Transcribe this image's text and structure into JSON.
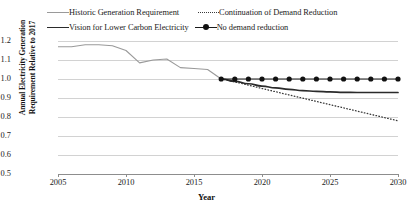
{
  "chart_data": {
    "type": "line",
    "title": "",
    "xlabel": "Year",
    "ylabel": "Annual Electricity Generation Requirement Relative to 2017",
    "ylabel_line1": "Annual Electricity Generation",
    "ylabel_line2": "Requirement Relative to 2017",
    "xlim": [
      2005,
      2030
    ],
    "ylim": [
      0.5,
      1.2
    ],
    "xticks": [
      2005,
      2010,
      2015,
      2020,
      2025,
      2030
    ],
    "yticks": [
      "0.5",
      "0.6",
      "0.7",
      "0.8",
      "0.9",
      "1.0",
      "1.1",
      "1.2"
    ],
    "grid": true,
    "legend_position": "top",
    "series": [
      {
        "name": "Historic Generation Requirement",
        "style": "solid-thin",
        "color": "#9a9a9a",
        "x": [
          2005,
          2006,
          2007,
          2008,
          2009,
          2010,
          2011,
          2012,
          2013,
          2014,
          2015,
          2016,
          2017
        ],
        "values": [
          1.17,
          1.17,
          1.18,
          1.18,
          1.175,
          1.15,
          1.085,
          1.1,
          1.105,
          1.06,
          1.055,
          1.05,
          1.0
        ]
      },
      {
        "name": "Continuation of Demand Reduction",
        "style": "dotted",
        "color": "#3a3a3a",
        "x": [
          2017,
          2018,
          2019,
          2020,
          2021,
          2022,
          2023,
          2024,
          2025,
          2026,
          2027,
          2028,
          2029,
          2030
        ],
        "values": [
          1.0,
          0.985,
          0.968,
          0.95,
          0.933,
          0.916,
          0.899,
          0.882,
          0.865,
          0.848,
          0.831,
          0.814,
          0.797,
          0.78
        ]
      },
      {
        "name": "Vision for Lower Carbon Electricity",
        "style": "solid-thick",
        "color": "#2b2b2b",
        "x": [
          2017,
          2018,
          2019,
          2020,
          2021,
          2022,
          2023,
          2024,
          2025,
          2026,
          2027,
          2028,
          2029,
          2030
        ],
        "values": [
          1.0,
          0.988,
          0.975,
          0.963,
          0.953,
          0.945,
          0.939,
          0.935,
          0.932,
          0.93,
          0.929,
          0.929,
          0.929,
          0.929
        ]
      },
      {
        "name": "No demand reduction",
        "style": "solid-marker",
        "color": "#111111",
        "marker": "circle",
        "x": [
          2017,
          2018,
          2019,
          2020,
          2021,
          2022,
          2023,
          2024,
          2025,
          2026,
          2027,
          2028,
          2029,
          2030
        ],
        "values": [
          1.0,
          1.0,
          1.0,
          1.0,
          1.0,
          1.0,
          1.0,
          1.0,
          1.0,
          1.0,
          1.0,
          1.0,
          1.0,
          1.0
        ]
      }
    ]
  },
  "legend": {
    "items": [
      {
        "label": "Historic Generation Requirement"
      },
      {
        "label": "Continuation of Demand Reduction"
      },
      {
        "label": "Vision for Lower Carbon Electricity"
      },
      {
        "label": "No demand reduction"
      }
    ]
  },
  "colors": {
    "historic": "#9a9a9a",
    "continuation": "#3a3a3a",
    "vision": "#2b2b2b",
    "no_reduction": "#111111",
    "grid": "#d2d2d2",
    "axis": "#8d8d8d",
    "background": "#ffffff"
  }
}
